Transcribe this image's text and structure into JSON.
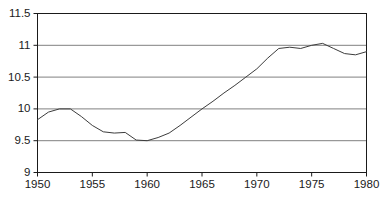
{
  "chart_data": {
    "type": "line",
    "title": "",
    "subtitle": "",
    "xlabel": "",
    "ylabel": "",
    "xlim": [
      1950,
      1980
    ],
    "ylim": [
      9,
      11.5
    ],
    "xticks": [
      1950,
      1955,
      1960,
      1965,
      1970,
      1975,
      1980
    ],
    "xtick_labels": [
      "1950",
      "1955",
      "1960",
      "1965",
      "1970",
      "1975",
      "1980"
    ],
    "yticks": [
      9,
      9.5,
      10,
      10.5,
      11,
      11.5
    ],
    "ytick_labels": [
      "9",
      "9.5",
      "10",
      "10.5",
      "11",
      "11.5"
    ],
    "grid": "horizontal",
    "grid_color": "#808080",
    "legend": "none",
    "legend_entries": [],
    "annotations": [],
    "series": [
      {
        "name": "series-1",
        "color": "#3c3c3c",
        "line_width": 1,
        "x": [
          1950,
          1951,
          1952,
          1953,
          1954,
          1955,
          1956,
          1957,
          1958,
          1959,
          1960,
          1961,
          1962,
          1963,
          1964,
          1965,
          1966,
          1967,
          1968,
          1969,
          1970,
          1971,
          1972,
          1973,
          1974,
          1975,
          1976,
          1977,
          1978,
          1979,
          1980
        ],
        "values": [
          9.83,
          9.95,
          10.0,
          10.0,
          9.88,
          9.74,
          9.64,
          9.62,
          9.63,
          9.51,
          9.5,
          9.55,
          9.62,
          9.74,
          9.87,
          10.0,
          10.12,
          10.25,
          10.37,
          10.5,
          10.63,
          10.8,
          10.95,
          10.97,
          10.95,
          11.0,
          11.03,
          10.95,
          10.87,
          10.85,
          10.9
        ]
      }
    ]
  },
  "axes": {
    "frame_color": "#1a1a1a",
    "background": "#ffffff"
  }
}
